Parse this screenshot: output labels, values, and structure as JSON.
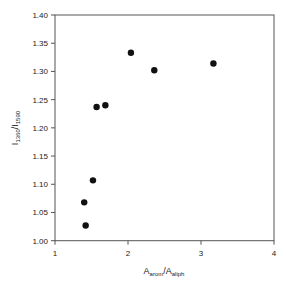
{
  "chart_data": {
    "type": "scatter",
    "title": "",
    "xlabel": "A_arom/A_aliph",
    "xlabel_main": "A",
    "xlabel_sub1": "arom",
    "xlabel_mid": "/A",
    "xlabel_sub2": "aliph",
    "ylabel": "I_1360/I_1590",
    "ylabel_main": "I",
    "ylabel_sub1": "1360",
    "ylabel_mid": "/I",
    "ylabel_sub2": "1590",
    "xlim": [
      1,
      4
    ],
    "ylim": [
      1.0,
      1.4
    ],
    "x_ticks": [
      1,
      2,
      3,
      4
    ],
    "x_tick_labels": [
      "1",
      "2",
      "3",
      "4"
    ],
    "y_ticks": [
      1.0,
      1.05,
      1.1,
      1.15,
      1.2,
      1.25,
      1.3,
      1.35,
      1.4
    ],
    "y_tick_labels": [
      "1.00",
      "1.05",
      "1.10",
      "1.15",
      "1.20",
      "1.25",
      "1.30",
      "1.35",
      "1.40"
    ],
    "grid": false,
    "legend": null,
    "marker": "filled-circle",
    "marker_color": "#111111",
    "series": [
      {
        "name": "samples",
        "points": [
          {
            "x": 1.42,
            "y": 1.027
          },
          {
            "x": 1.4,
            "y": 1.068
          },
          {
            "x": 1.52,
            "y": 1.107
          },
          {
            "x": 1.57,
            "y": 1.237
          },
          {
            "x": 1.69,
            "y": 1.24
          },
          {
            "x": 2.04,
            "y": 1.333
          },
          {
            "x": 2.36,
            "y": 1.302
          },
          {
            "x": 3.17,
            "y": 1.314
          }
        ]
      }
    ]
  }
}
